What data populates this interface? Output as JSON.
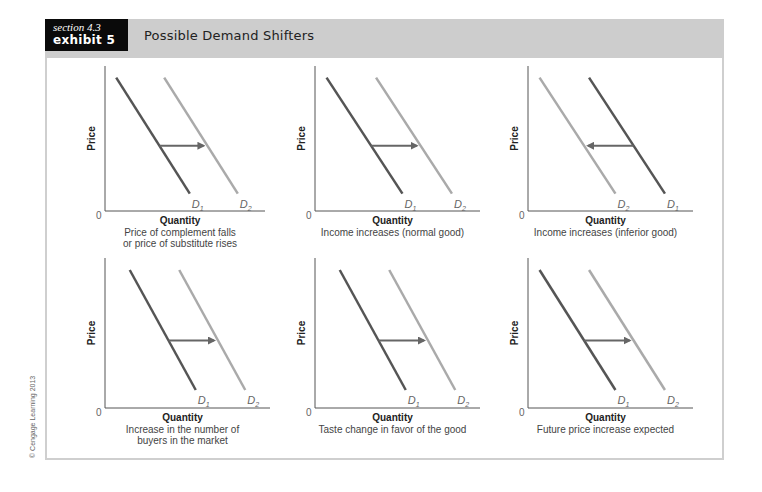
{
  "header": {
    "section": "section 4.3",
    "exhibit": "exhibit 5",
    "title": "Possible Demand Shifters"
  },
  "copyright": "© Cengage Learning 2013",
  "colors": {
    "header_band": "#cdcdcd",
    "label_box": "#0a0a0a",
    "d1_curve": "#555555",
    "d2_curve": "#aaaaaa",
    "arrow": "#666666"
  },
  "axis": {
    "x_label": "Quantity",
    "y_label": "Price",
    "origin": "0"
  },
  "chart_data": [
    {
      "type": "line",
      "title": "Price of complement falls or price of substitute rises",
      "caption_lines": [
        "Price of complement falls",
        "or price of substitute rises"
      ],
      "xlabel": "Quantity",
      "ylabel": "Price",
      "series": [
        {
          "name": "D1",
          "points": [
            [
              0.07,
              0.92
            ],
            [
              0.53,
              0.12
            ]
          ]
        },
        {
          "name": "D2",
          "points": [
            [
              0.37,
              0.92
            ],
            [
              0.83,
              0.12
            ]
          ]
        }
      ],
      "shift": "right",
      "grid": false
    },
    {
      "type": "line",
      "title": "Income increases (normal good)",
      "caption_lines": [
        "Income increases (normal good)"
      ],
      "xlabel": "Quantity",
      "ylabel": "Price",
      "series": [
        {
          "name": "D1",
          "points": [
            [
              0.07,
              0.92
            ],
            [
              0.53,
              0.12
            ]
          ]
        },
        {
          "name": "D2",
          "points": [
            [
              0.37,
              0.92
            ],
            [
              0.83,
              0.12
            ]
          ]
        }
      ],
      "shift": "right",
      "grid": false
    },
    {
      "type": "line",
      "title": "Income increases (inferior good)",
      "caption_lines": [
        "Income increases (inferior good)"
      ],
      "xlabel": "Quantity",
      "ylabel": "Price",
      "series": [
        {
          "name": "D1",
          "points": [
            [
              0.37,
              0.92
            ],
            [
              0.83,
              0.12
            ]
          ]
        },
        {
          "name": "D2",
          "points": [
            [
              0.07,
              0.92
            ],
            [
              0.53,
              0.12
            ]
          ]
        }
      ],
      "shift": "left",
      "grid": false
    },
    {
      "type": "line",
      "title": "Increase in the number of buyers in the market",
      "caption_lines": [
        "Increase in the number of",
        "buyers in the market"
      ],
      "xlabel": "Quantity",
      "ylabel": "Price",
      "series": [
        {
          "name": "D1",
          "points": [
            [
              0.15,
              0.92
            ],
            [
              0.55,
              0.12
            ]
          ]
        },
        {
          "name": "D2",
          "points": [
            [
              0.45,
              0.92
            ],
            [
              0.85,
              0.12
            ]
          ]
        }
      ],
      "shift": "right",
      "grid": false
    },
    {
      "type": "line",
      "title": "Taste change in favor of the good",
      "caption_lines": [
        "Taste change in favor of the good"
      ],
      "xlabel": "Quantity",
      "ylabel": "Price",
      "series": [
        {
          "name": "D1",
          "points": [
            [
              0.15,
              0.92
            ],
            [
              0.55,
              0.12
            ]
          ]
        },
        {
          "name": "D2",
          "points": [
            [
              0.45,
              0.92
            ],
            [
              0.85,
              0.12
            ]
          ]
        }
      ],
      "shift": "right",
      "grid": false
    },
    {
      "type": "line",
      "title": "Future price increase expected",
      "caption_lines": [
        "Future price increase expected"
      ],
      "xlabel": "Quantity",
      "ylabel": "Price",
      "series": [
        {
          "name": "D1",
          "points": [
            [
              0.07,
              0.92
            ],
            [
              0.53,
              0.12
            ]
          ]
        },
        {
          "name": "D2",
          "points": [
            [
              0.37,
              0.92
            ],
            [
              0.83,
              0.12
            ]
          ]
        }
      ],
      "shift": "right",
      "grid": false
    }
  ]
}
